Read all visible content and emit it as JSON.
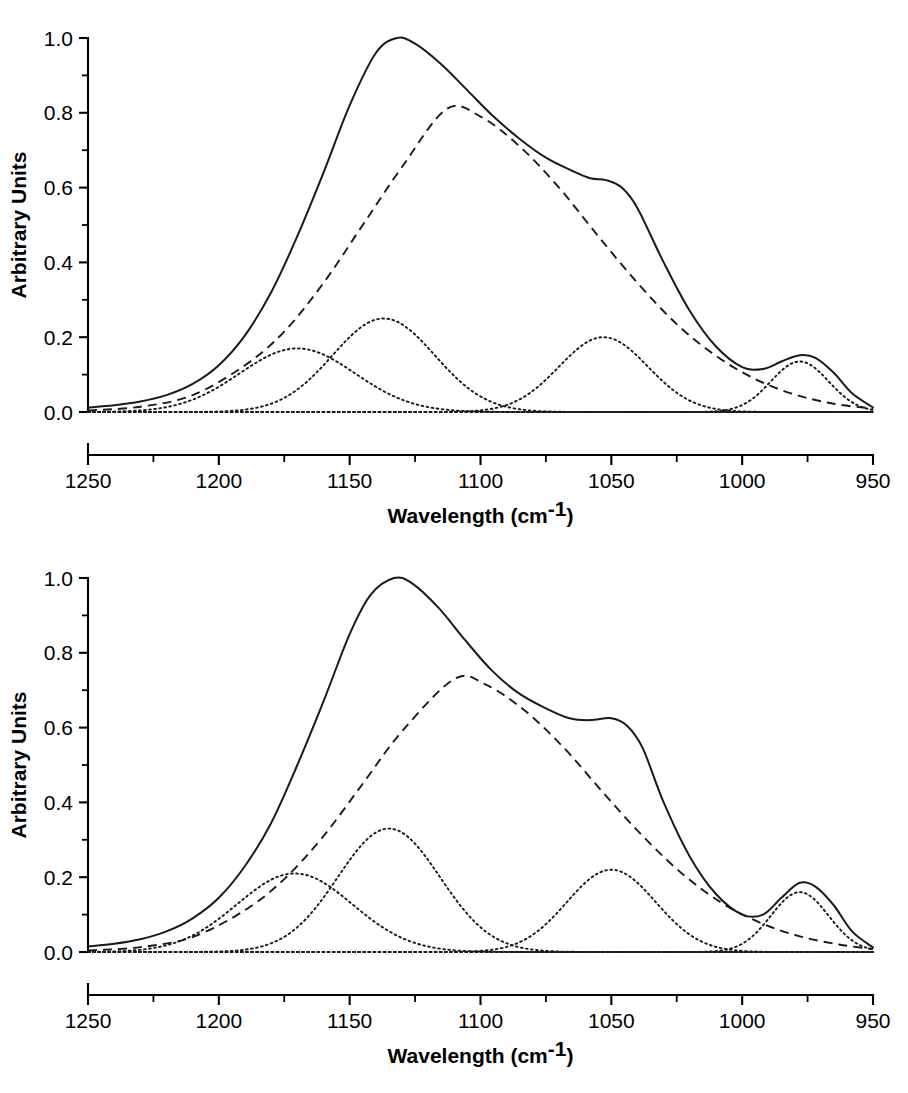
{
  "figure": {
    "panel_count": 2,
    "background_color": "#ffffff",
    "line_color": "#1a1a1a"
  },
  "axes": {
    "xlabel_main": "Wavelength (cm",
    "xlabel_sup": "-1",
    "xlabel_close": ")",
    "ylabel": "Arbitrary Units",
    "x_ticks": [
      "1250",
      "1200",
      "1150",
      "1100",
      "1050",
      "1000",
      "950"
    ],
    "x_tick_values": [
      1250,
      1200,
      1150,
      1100,
      1050,
      1000,
      950
    ],
    "y_ticks": [
      "0.0",
      "0.2",
      "0.4",
      "0.6",
      "0.8",
      "1.0"
    ],
    "y_tick_values": [
      0.0,
      0.2,
      0.4,
      0.6,
      0.8,
      1.0
    ],
    "xlim": [
      1250,
      950
    ],
    "ylim": [
      0.0,
      1.0
    ],
    "x_reversed": true,
    "minor_ticks_per_interval": 1,
    "grid": false,
    "legend": "none"
  },
  "chart_data": [
    {
      "type": "line",
      "panel": "top",
      "title": "",
      "xlabel": "Wavelength (cm-1)",
      "ylabel": "Arbitrary Units",
      "xlim": [
        1250,
        950
      ],
      "ylim": [
        0.0,
        1.0
      ],
      "x_reversed": true,
      "grid": false,
      "series": [
        {
          "name": "measured envelope",
          "style": "solid",
          "peak_x": 1132,
          "peak_y": 1.0,
          "shoulder_x": 1052,
          "shoulder_y": 0.62,
          "secondary_peak_x": 978,
          "secondary_peak_y": 0.15,
          "x": [
            1250,
            1240,
            1230,
            1220,
            1210,
            1200,
            1190,
            1180,
            1170,
            1160,
            1150,
            1140,
            1132,
            1125,
            1115,
            1105,
            1095,
            1085,
            1075,
            1065,
            1058,
            1052,
            1046,
            1040,
            1030,
            1020,
            1010,
            1000,
            992,
            985,
            978,
            972,
            965,
            958,
            950
          ],
          "y": [
            0.012,
            0.018,
            0.028,
            0.045,
            0.075,
            0.125,
            0.205,
            0.32,
            0.47,
            0.64,
            0.82,
            0.96,
            1.0,
            0.985,
            0.93,
            0.86,
            0.79,
            0.73,
            0.68,
            0.645,
            0.625,
            0.62,
            0.6,
            0.545,
            0.4,
            0.27,
            0.175,
            0.12,
            0.115,
            0.135,
            0.152,
            0.145,
            0.105,
            0.05,
            0.012
          ]
        },
        {
          "name": "broad underlying band",
          "style": "dashed",
          "peak_x": 1113,
          "peak_y": 0.81,
          "fwhm": 118,
          "x": [
            1250,
            1230,
            1210,
            1190,
            1175,
            1160,
            1145,
            1130,
            1113,
            1100,
            1085,
            1070,
            1055,
            1040,
            1025,
            1010,
            995,
            980,
            965,
            950
          ],
          "y": [
            0.004,
            0.014,
            0.045,
            0.125,
            0.215,
            0.345,
            0.5,
            0.655,
            0.81,
            0.79,
            0.71,
            0.6,
            0.47,
            0.345,
            0.235,
            0.15,
            0.088,
            0.047,
            0.022,
            0.009
          ]
        },
        {
          "name": "component 1",
          "style": "dotted",
          "peak_x": 1170,
          "peak_y": 0.17,
          "fwhm": 52
        },
        {
          "name": "component 2",
          "style": "dotted",
          "peak_x": 1137,
          "peak_y": 0.25,
          "fwhm": 46
        },
        {
          "name": "component 3",
          "style": "dotted",
          "peak_x": 1053,
          "peak_y": 0.2,
          "fwhm": 40
        },
        {
          "name": "component 4",
          "style": "dotted",
          "peak_x": 978,
          "peak_y": 0.135,
          "fwhm": 26
        },
        {
          "name": "baseline",
          "style": "dotted",
          "peak_y": 0.0,
          "constant": 0.0
        }
      ]
    },
    {
      "type": "line",
      "panel": "bottom",
      "title": "",
      "xlabel": "Wavelength (cm-1)",
      "ylabel": "Arbitrary Units",
      "xlim": [
        1250,
        950
      ],
      "ylim": [
        0.0,
        1.0
      ],
      "x_reversed": true,
      "grid": false,
      "series": [
        {
          "name": "measured envelope",
          "style": "solid",
          "peak_x": 1133,
          "peak_y": 1.0,
          "shoulder_x": 1050,
          "shoulder_y": 0.62,
          "secondary_peak_x": 978,
          "secondary_peak_y": 0.185,
          "x": [
            1250,
            1240,
            1230,
            1220,
            1210,
            1200,
            1190,
            1180,
            1170,
            1160,
            1150,
            1142,
            1133,
            1126,
            1116,
            1106,
            1096,
            1086,
            1076,
            1066,
            1058,
            1050,
            1044,
            1038,
            1030,
            1020,
            1010,
            1000,
            992,
            985,
            978,
            972,
            965,
            958,
            950
          ],
          "y": [
            0.015,
            0.022,
            0.034,
            0.055,
            0.09,
            0.145,
            0.23,
            0.345,
            0.5,
            0.67,
            0.85,
            0.955,
            1.0,
            0.985,
            0.92,
            0.835,
            0.755,
            0.695,
            0.655,
            0.625,
            0.62,
            0.625,
            0.605,
            0.545,
            0.4,
            0.255,
            0.155,
            0.1,
            0.1,
            0.145,
            0.185,
            0.175,
            0.125,
            0.055,
            0.012
          ]
        },
        {
          "name": "broad underlying band",
          "style": "dashed",
          "peak_x": 1110,
          "peak_y": 0.73,
          "fwhm": 118,
          "x": [
            1250,
            1230,
            1210,
            1190,
            1175,
            1160,
            1145,
            1130,
            1110,
            1098,
            1083,
            1068,
            1053,
            1038,
            1023,
            1008,
            993,
            978,
            963,
            950
          ],
          "y": [
            0.004,
            0.013,
            0.04,
            0.112,
            0.195,
            0.31,
            0.45,
            0.59,
            0.73,
            0.715,
            0.645,
            0.545,
            0.425,
            0.31,
            0.21,
            0.132,
            0.078,
            0.042,
            0.02,
            0.008
          ]
        },
        {
          "name": "component 1",
          "style": "dotted",
          "peak_x": 1171,
          "peak_y": 0.21,
          "fwhm": 52
        },
        {
          "name": "component 2",
          "style": "dotted",
          "peak_x": 1135,
          "peak_y": 0.33,
          "fwhm": 46
        },
        {
          "name": "component 3",
          "style": "dotted",
          "peak_x": 1050,
          "peak_y": 0.22,
          "fwhm": 40
        },
        {
          "name": "component 4",
          "style": "dotted",
          "peak_x": 978,
          "peak_y": 0.16,
          "fwhm": 26
        },
        {
          "name": "baseline",
          "style": "dotted",
          "peak_y": 0.0,
          "constant": 0.0
        }
      ]
    }
  ]
}
